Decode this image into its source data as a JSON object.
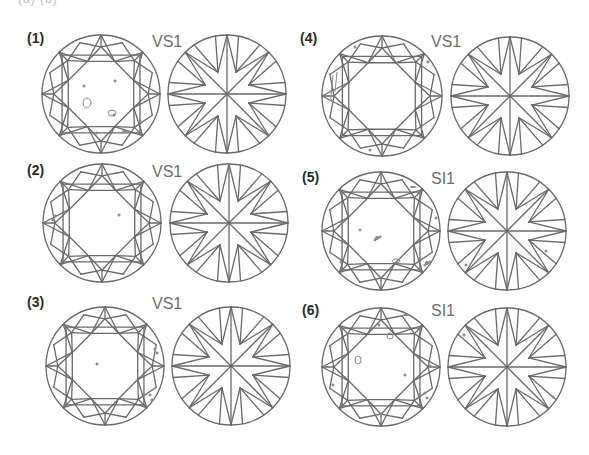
{
  "figure": {
    "top_cutoff_text": "(a) (b)",
    "colors": {
      "line": "#6a6a6a",
      "label": "#2a2a2a",
      "grade": "#6e6e6e",
      "inclusion": "#8a8a8a",
      "background": "#ffffff"
    },
    "panels": [
      {
        "label": "(1)",
        "grade": "VS1",
        "label_pos": [
          27,
          31
        ],
        "grade_pos": [
          152,
          34
        ],
        "crown": {
          "cx": 101,
          "cy": 94,
          "r": 59
        },
        "pavilion": {
          "cx": 227,
          "cy": 94,
          "r": 59
        },
        "inclusions": [
          {
            "type": "ring",
            "x": 87,
            "y": 103,
            "rx": 4,
            "ry": 5
          },
          {
            "type": "ring",
            "x": 112,
            "y": 113,
            "rx": 4,
            "ry": 3
          },
          {
            "type": "dot",
            "x": 114,
            "y": 115
          },
          {
            "type": "dot",
            "x": 84,
            "y": 86
          },
          {
            "type": "dot",
            "x": 115,
            "y": 81
          },
          {
            "type": "dash",
            "x": 125,
            "y": 131
          },
          {
            "type": "dot",
            "x": 97,
            "y": 133
          },
          {
            "type": "dot",
            "x": 140,
            "y": 121
          }
        ]
      },
      {
        "label": "(2)",
        "grade": "VS1",
        "label_pos": [
          27,
          163
        ],
        "grade_pos": [
          152,
          164
        ],
        "crown": {
          "cx": 102,
          "cy": 223,
          "r": 59
        },
        "pavilion": {
          "cx": 229,
          "cy": 223,
          "r": 59
        },
        "inclusions": [
          {
            "type": "dot",
            "x": 55,
            "y": 216
          },
          {
            "type": "dot",
            "x": 53,
            "y": 220
          },
          {
            "type": "dot",
            "x": 119,
            "y": 215
          }
        ]
      },
      {
        "label": "(3)",
        "grade": "VS1",
        "label_pos": [
          27,
          295
        ],
        "grade_pos": [
          152,
          296
        ],
        "crown": {
          "cx": 105,
          "cy": 366,
          "r": 59
        },
        "pavilion": {
          "cx": 231,
          "cy": 366,
          "r": 59
        },
        "inclusions": [
          {
            "type": "dot",
            "x": 97,
            "y": 364
          },
          {
            "type": "dot",
            "x": 157,
            "y": 353
          },
          {
            "type": "dot",
            "x": 155,
            "y": 349
          },
          {
            "type": "dot",
            "x": 150,
            "y": 395
          },
          {
            "type": "dot",
            "x": 152,
            "y": 400
          }
        ]
      },
      {
        "label": "(4)",
        "grade": "VS1",
        "label_pos": [
          300,
          31
        ],
        "grade_pos": [
          431,
          34
        ],
        "crown": {
          "cx": 382,
          "cy": 96,
          "r": 60
        },
        "pavilion": {
          "cx": 510,
          "cy": 96,
          "r": 59
        },
        "inclusions": [
          {
            "type": "line",
            "x1": 333,
            "y1": 75,
            "x2": 331,
            "y2": 95
          },
          {
            "type": "line",
            "x1": 337,
            "y1": 72,
            "x2": 335,
            "y2": 92
          },
          {
            "type": "line",
            "x1": 329,
            "y1": 95,
            "x2": 333,
            "y2": 103
          },
          {
            "type": "dot",
            "x": 355,
            "y": 47
          },
          {
            "type": "dot",
            "x": 428,
            "y": 62
          },
          {
            "type": "dot",
            "x": 370,
            "y": 150
          },
          {
            "type": "dash",
            "x": 433,
            "y": 96
          }
        ]
      },
      {
        "label": "(5)",
        "grade": "SI1",
        "label_pos": [
          302,
          170
        ],
        "grade_pos": [
          431,
          171
        ],
        "crown": {
          "cx": 381,
          "cy": 231,
          "r": 59
        },
        "pavilion": {
          "cx": 507,
          "cy": 231,
          "r": 59
        },
        "inclusions": [
          {
            "type": "cluster",
            "x": 377,
            "y": 238
          },
          {
            "type": "dot",
            "x": 360,
            "y": 230
          },
          {
            "type": "dash",
            "x": 413,
            "y": 187
          },
          {
            "type": "dot",
            "x": 436,
            "y": 218
          },
          {
            "type": "ring",
            "x": 396,
            "y": 261,
            "rx": 4,
            "ry": 2
          },
          {
            "type": "cluster",
            "x": 427,
            "y": 263
          },
          {
            "type": "dot",
            "x": 341,
            "y": 222
          },
          {
            "type": "dot",
            "x": 341,
            "y": 262
          },
          {
            "type": "dot",
            "x": 546,
            "y": 251
          },
          {
            "type": "dot",
            "x": 466,
            "y": 265
          }
        ]
      },
      {
        "label": "(6)",
        "grade": "SI1",
        "label_pos": [
          302,
          303
        ],
        "grade_pos": [
          431,
          303
        ],
        "crown": {
          "cx": 381,
          "cy": 367,
          "r": 59
        },
        "pavilion": {
          "cx": 507,
          "cy": 367,
          "r": 59
        },
        "inclusions": [
          {
            "type": "ring",
            "x": 358,
            "y": 360,
            "rx": 3,
            "ry": 4
          },
          {
            "type": "ring",
            "x": 390,
            "y": 336,
            "rx": 3,
            "ry": 3
          },
          {
            "type": "dot",
            "x": 379,
            "y": 325
          },
          {
            "type": "dash",
            "x": 406,
            "y": 315
          },
          {
            "type": "dot",
            "x": 405,
            "y": 375
          },
          {
            "type": "dot",
            "x": 381,
            "y": 414
          },
          {
            "type": "dot",
            "x": 425,
            "y": 393
          },
          {
            "type": "dot",
            "x": 427,
            "y": 398
          },
          {
            "type": "dot",
            "x": 333,
            "y": 385
          },
          {
            "type": "dot",
            "x": 430,
            "y": 366
          },
          {
            "type": "dot",
            "x": 553,
            "y": 397
          },
          {
            "type": "dot",
            "x": 464,
            "y": 335
          }
        ]
      }
    ]
  }
}
